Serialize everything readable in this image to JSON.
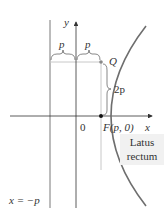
{
  "diagram": {
    "labels": {
      "y_axis": "y",
      "x_axis": "x",
      "origin": "0",
      "focus": "F(p, 0)",
      "point": "Q",
      "half_latus": "2p",
      "brace_left": "p",
      "brace_right": "p",
      "directrix": "x = −p",
      "latus_line1": "Latus",
      "latus_line2": "rectum"
    },
    "colors": {
      "curve": "#6e6e6e",
      "axis": "#333333",
      "guide": "#bfbfbf",
      "box": "#f1f1f1"
    }
  }
}
